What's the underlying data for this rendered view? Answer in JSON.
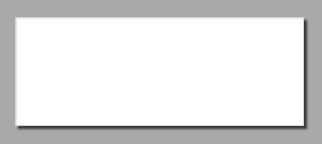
{
  "canvas": {
    "width": 322,
    "height": 144,
    "background": "#a9a9a9"
  },
  "board": {
    "x": 15,
    "y": 17,
    "width": 287,
    "height": 107,
    "fill": "#ffffff",
    "grid": {
      "columns": 14,
      "rows": 5,
      "color": "#cfcfcf",
      "x_lines": [
        16,
        37,
        57,
        77,
        97,
        118,
        138,
        158,
        178,
        199,
        219,
        239,
        260,
        280,
        300
      ],
      "y_lines": [
        18,
        39,
        60,
        81,
        102,
        123
      ]
    }
  },
  "segments": [
    {
      "name": "vertical-stem",
      "x1": 37,
      "y1": 39,
      "x2": 37,
      "y2": 122,
      "color": "#111111",
      "width": 2.5
    },
    {
      "name": "rising-diagonal",
      "x1": 57,
      "y1": 121,
      "x2": 134,
      "y2": 44,
      "color": "#111111",
      "width": 2.5
    },
    {
      "name": "falling-diagonal",
      "x1": 203,
      "y1": 64,
      "x2": 257,
      "y2": 120,
      "color": "#111111",
      "width": 2.5
    }
  ],
  "handles": [
    {
      "name": "handle-top-of-rising-line",
      "cx": 138,
      "cy": 40,
      "r": 6,
      "fill": "#ffffff",
      "stroke": "#8a8a8a"
    },
    {
      "name": "handle-top-of-falling-line",
      "cx": 199,
      "cy": 60,
      "r": 6,
      "fill": "#ffffff",
      "stroke": "#8a8a8a"
    }
  ],
  "markers": [
    {
      "name": "flower-icon",
      "cx": 37,
      "cy": 37,
      "petal_r": 3,
      "color": "#6a6a6a",
      "center_color": "#9a9a9a"
    }
  ]
}
